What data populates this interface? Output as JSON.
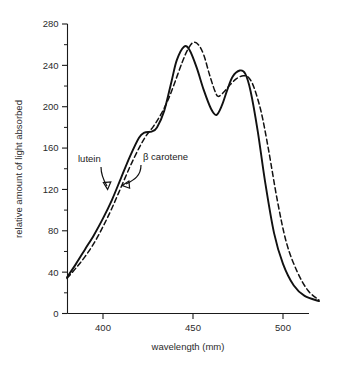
{
  "chart_data": {
    "type": "line",
    "title": "",
    "xlabel": "wavelength (mm)",
    "ylabel": "relative amount of light absorbed",
    "xlim": [
      380,
      520
    ],
    "ylim": [
      0,
      280
    ],
    "grid": false,
    "legend_position": "inline-annotations",
    "x_ticks": [
      400,
      450,
      500
    ],
    "x_tick_labels": [
      "400",
      "450",
      "500"
    ],
    "x_minor_ticks": [],
    "y_ticks": [
      0,
      40,
      80,
      120,
      160,
      200,
      240,
      280
    ],
    "y_tick_labels": [
      "0",
      "40",
      "80",
      "120",
      "160",
      "200",
      "240",
      "280"
    ],
    "y_minor_ticks": [
      20,
      60,
      100,
      140,
      180,
      220,
      260
    ],
    "series": [
      {
        "name": "lutein",
        "style": "solid",
        "color": "#111111",
        "x": [
          380,
          385,
          390,
          395,
          400,
          405,
          410,
          415,
          420,
          423,
          427,
          430,
          434,
          438,
          441,
          445,
          448,
          452,
          456,
          460,
          463,
          466,
          469,
          472,
          476,
          479,
          482,
          486,
          490,
          495,
          500,
          506,
          512,
          520
        ],
        "y": [
          35,
          48,
          62,
          76,
          92,
          110,
          131,
          152,
          170,
          175,
          176,
          180,
          196,
          224,
          245,
          258,
          255,
          238,
          216,
          198,
          192,
          201,
          216,
          229,
          235,
          232,
          215,
          176,
          128,
          78,
          48,
          27,
          17,
          12
        ]
      },
      {
        "name": "β carotene",
        "style": "dashed",
        "color": "#111111",
        "x": [
          380,
          385,
          390,
          395,
          400,
          405,
          410,
          415,
          420,
          424,
          428,
          432,
          436,
          440,
          444,
          447,
          450,
          453,
          456,
          459,
          462,
          464,
          467,
          470,
          474,
          478,
          481,
          484,
          488,
          492,
          497,
          502,
          508,
          514,
          520
        ],
        "y": [
          34,
          44,
          55,
          68,
          84,
          102,
          122,
          142,
          160,
          172,
          181,
          192,
          206,
          224,
          243,
          255,
          262,
          260,
          250,
          232,
          216,
          210,
          214,
          220,
          227,
          230,
          228,
          218,
          194,
          158,
          108,
          68,
          40,
          22,
          13
        ]
      }
    ],
    "annotations": [
      {
        "text": "lutein",
        "target_series": "lutein",
        "target_x": 406,
        "target_y": 120
      },
      {
        "text": "β carotene",
        "target_series": "β carotene",
        "target_x": 416,
        "target_y": 128
      }
    ]
  }
}
